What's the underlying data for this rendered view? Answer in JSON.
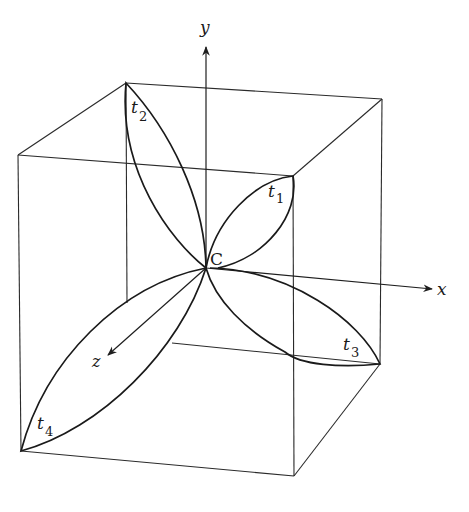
{
  "figure": {
    "colors": {
      "ink": "#1a1a1a",
      "background": "#ffffff"
    }
  },
  "axes": {
    "x": {
      "label": "x"
    },
    "y": {
      "label": "y"
    },
    "z": {
      "label": "z"
    }
  },
  "center": {
    "label": "C"
  },
  "lobes": [
    {
      "base": "t",
      "sub": "1"
    },
    {
      "base": "t",
      "sub": "2"
    },
    {
      "base": "t",
      "sub": "3"
    },
    {
      "base": "t",
      "sub": "4"
    }
  ]
}
